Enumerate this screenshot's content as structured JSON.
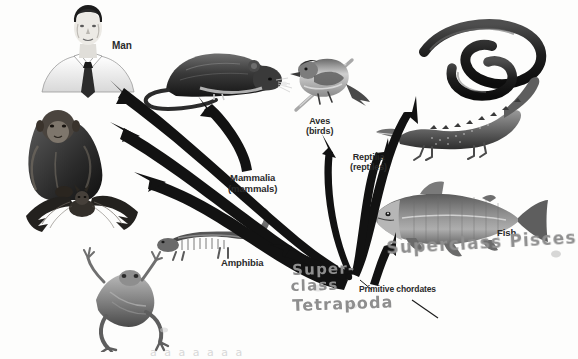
{
  "figure": {
    "kind": "vertebrate-evolution-diagram",
    "background_color": "#fdfdfc",
    "ink_color": "#1a1a1a",
    "pencil_color": "#8e8e8e"
  },
  "labels": {
    "man": "Man",
    "mammalia": "Mammalia",
    "mammalia_sub": "(mammals)",
    "amphibia": "Amphibia",
    "aves": "Aves",
    "aves_sub": "(birds)",
    "reptilia": "Reptilia",
    "reptilia_sub": "(reptiles)",
    "fish": "Fish",
    "primitive_chordates": "Primitive chordates"
  },
  "annotations": {
    "pisces": "Superclass Pisces",
    "super": "Super-",
    "class": "class",
    "tetrapoda": "Tetrapoda",
    "bottom_bleed": "a  a  a    a  a  a  a"
  },
  "organisms": [
    {
      "name": "man",
      "label": "Man",
      "position": "top-left"
    },
    {
      "name": "chimpanzee",
      "label": "",
      "position": "left-upper"
    },
    {
      "name": "bat",
      "label": "",
      "position": "left-middle"
    },
    {
      "name": "frog",
      "label": "",
      "position": "bottom-left"
    },
    {
      "name": "rat",
      "label": "",
      "position": "top-center"
    },
    {
      "name": "salamander",
      "label": "Amphibia",
      "position": "center-lower"
    },
    {
      "name": "bird",
      "label": "Aves",
      "position": "top-right-center"
    },
    {
      "name": "snake",
      "label": "",
      "position": "top-right"
    },
    {
      "name": "crocodile",
      "label": "Reptilia",
      "position": "right-middle"
    },
    {
      "name": "fish",
      "label": "Fish",
      "position": "right-lower"
    }
  ],
  "arrows": [
    {
      "from": "primitive-chordates",
      "to": "man"
    },
    {
      "from": "primitive-chordates",
      "to": "chimpanzee"
    },
    {
      "from": "primitive-chordates",
      "to": "bat"
    },
    {
      "from": "mammalia",
      "to": "rat"
    },
    {
      "from": "primitive-chordates",
      "to": "amphibia"
    },
    {
      "from": "primitive-chordates",
      "to": "aves"
    },
    {
      "from": "primitive-chordates",
      "to": "snake"
    },
    {
      "from": "primitive-chordates",
      "to": "reptilia"
    },
    {
      "from": "primitive-chordates",
      "to": "fish"
    }
  ]
}
